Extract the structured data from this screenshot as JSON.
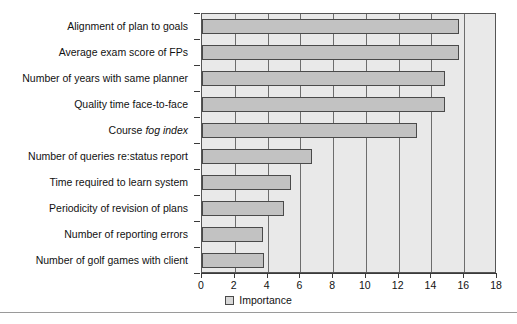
{
  "chart_data": {
    "type": "bar",
    "orientation": "horizontal",
    "title": "",
    "xlabel": "",
    "ylabel": "",
    "xlim": [
      0,
      18
    ],
    "xticks": [
      0,
      2,
      4,
      6,
      8,
      10,
      12,
      14,
      16,
      18
    ],
    "grid": true,
    "grid_axis": "x",
    "legend": {
      "position": "bottom-center",
      "entries": [
        {
          "label": "Importance",
          "color": "#d8d8d8"
        }
      ]
    },
    "series": [
      {
        "name": "Importance",
        "color": "#c2c2c2",
        "edge_color": "#4a4a4a"
      }
    ],
    "categories": [
      "Alignment of plan to goals",
      "Average exam score of FPs",
      "Number of years with same planner",
      "Quality time face-to-face",
      "Course fog index",
      "Number of queries re:status report",
      "Time required to learn system",
      "Periodicity of revision of plans",
      "Number of reporting errors",
      "Number of golf games with client"
    ],
    "category_styles": [
      {
        "plain": "Alignment of plan to goals",
        "italic": ""
      },
      {
        "plain": "Average exam score of FPs",
        "italic": ""
      },
      {
        "plain": "Number of years with same planner",
        "italic": ""
      },
      {
        "plain": "Quality time face-to-face",
        "italic": ""
      },
      {
        "plain": "Course ",
        "italic": "fog index"
      },
      {
        "plain": "Number of queries re:status report",
        "italic": ""
      },
      {
        "plain": "Time required to learn system",
        "italic": ""
      },
      {
        "plain": "Periodicity of revision of plans",
        "italic": ""
      },
      {
        "plain": "Number of reporting errors",
        "italic": ""
      },
      {
        "plain": "Number of golf games with client",
        "italic": ""
      }
    ],
    "values": [
      15.7,
      15.7,
      14.8,
      14.8,
      13.1,
      6.7,
      5.4,
      5.0,
      3.7,
      3.8
    ]
  },
  "colors": {
    "plot_background": "#e9e9e9",
    "bar_fill": "#c2c2c2",
    "bar_edge": "#4a4a4a",
    "gridline": "#6d6d6d",
    "axis": "#3a3a3a",
    "text": "#111111"
  }
}
